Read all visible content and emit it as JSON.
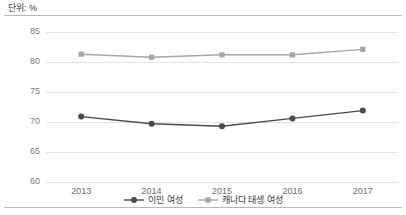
{
  "unit_label": "단위: %",
  "axis": {
    "y_ticks": [
      "85",
      "80",
      "75",
      "70",
      "65",
      "60"
    ],
    "x_ticks": [
      "2013",
      "2014",
      "2015",
      "2016",
      "2017"
    ]
  },
  "legend": {
    "items": [
      {
        "label": "이민 여성",
        "marker": "circle-marker",
        "color": "#4a4a4a"
      },
      {
        "label": "캐나다 태생 여성",
        "marker": "cross-marker",
        "color": "#a6a6a6"
      }
    ]
  },
  "colors": {
    "series_immigrant": "#4a4a4a",
    "series_canadian_born": "#a6a6a6",
    "gridline": "#e4e4e4",
    "frame_rule": "#b8b8b8",
    "tick_text": "#7d7d7d"
  },
  "chart_data": {
    "type": "line",
    "title": "",
    "subtitle": "",
    "xlabel": "",
    "ylabel": "단위: %",
    "categories": [
      "2013",
      "2014",
      "2015",
      "2016",
      "2017"
    ],
    "ylim": [
      60,
      85
    ],
    "ytick_step": 5,
    "grid": true,
    "legend_position": "bottom-center",
    "series": [
      {
        "name": "이민 여성",
        "values": [
          70.9,
          69.7,
          69.3,
          70.6,
          71.9
        ],
        "color": "#4a4a4a",
        "marker": "circle"
      },
      {
        "name": "캐나다 태생 여성",
        "values": [
          81.3,
          80.8,
          81.2,
          81.2,
          82.1
        ],
        "color": "#a6a6a6",
        "marker": "cross"
      }
    ]
  }
}
